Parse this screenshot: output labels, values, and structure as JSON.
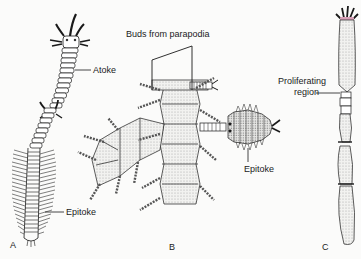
{
  "figure": {
    "panels": [
      {
        "id": "A",
        "label": "A",
        "labels": [
          "Atoke",
          "Epitoke"
        ]
      },
      {
        "id": "B",
        "label": "B",
        "labels": [
          "Buds from parapodia",
          "Epitoke"
        ]
      },
      {
        "id": "C",
        "label": "C",
        "labels": [
          "Proliferating region"
        ]
      }
    ],
    "labels": {
      "a_atoke": "Atoke",
      "a_epitoke": "Epitoke",
      "b_buds": "Buds from parapodia",
      "b_epitoke": "Epitoke",
      "c_proliferating_1": "Proliferating",
      "c_proliferating_2": "region"
    },
    "panel_letters": {
      "a": "A",
      "b": "B",
      "c": "C"
    },
    "colors": {
      "line": "#1a1a1a",
      "stipple": "#cfcfcf",
      "accent_pink": "#d9a0b8"
    }
  }
}
